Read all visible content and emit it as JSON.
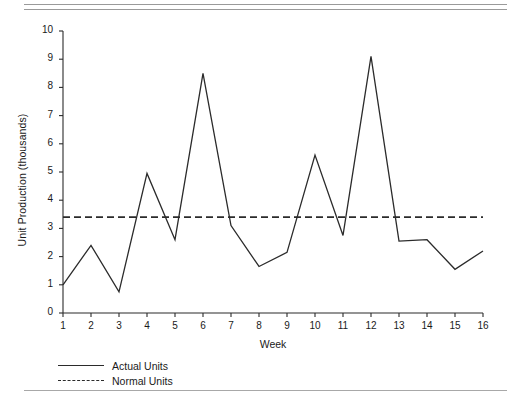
{
  "chart_data": {
    "type": "line",
    "title": "",
    "xlabel": "Week",
    "ylabel": "Unit Production (thousands)",
    "x": [
      1,
      2,
      3,
      4,
      5,
      6,
      7,
      8,
      9,
      10,
      11,
      12,
      13,
      14,
      15,
      16
    ],
    "xtick_labels": [
      "1",
      "2",
      "3",
      "4",
      "5",
      "6",
      "7",
      "8",
      "9",
      "10",
      "11",
      "12",
      "13",
      "14",
      "15",
      "16"
    ],
    "ytick_labels": [
      "0",
      "1",
      "2",
      "3",
      "4",
      "5",
      "6",
      "7",
      "8",
      "9",
      "10"
    ],
    "yticks": [
      0,
      1,
      2,
      3,
      4,
      5,
      6,
      7,
      8,
      9,
      10
    ],
    "xlim": [
      1,
      16
    ],
    "ylim": [
      0,
      10
    ],
    "grid": false,
    "legend_position": "below-axes-left",
    "series": [
      {
        "name": "Actual Units",
        "style": "solid",
        "color": "#2b2b2b",
        "values": [
          1.0,
          2.4,
          0.75,
          4.95,
          2.6,
          8.5,
          3.1,
          1.65,
          2.15,
          5.6,
          2.75,
          9.1,
          2.55,
          2.6,
          1.55,
          2.2
        ]
      },
      {
        "name": "Normal Units",
        "style": "dashed",
        "color": "#2b2b2b",
        "constant": 3.4,
        "values": [
          3.4,
          3.4,
          3.4,
          3.4,
          3.4,
          3.4,
          3.4,
          3.4,
          3.4,
          3.4,
          3.4,
          3.4,
          3.4,
          3.4,
          3.4,
          3.4
        ]
      }
    ]
  },
  "legend": {
    "items": [
      {
        "label": "Actual Units",
        "style": "solid"
      },
      {
        "label": "Normal Units",
        "style": "dashed"
      }
    ]
  },
  "axes": {
    "x_title": "Week",
    "y_title": "Unit Production (thousands)"
  }
}
